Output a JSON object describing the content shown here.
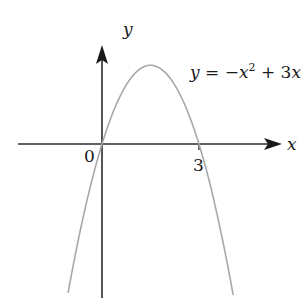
{
  "diagram": {
    "axes": {
      "x_label": "x",
      "y_label": "y",
      "origin_label": "0",
      "tick_labels": [
        "3"
      ]
    },
    "curve": {
      "equation_label": "y = −x² + 3x",
      "eq_y": "y",
      "eq_mid": " = −",
      "eq_x1": "x",
      "eq_exp": "2",
      "eq_plus": " + 3",
      "eq_x2": "x",
      "vertex": [
        1.5,
        2.25
      ],
      "roots": [
        0,
        3
      ],
      "color": "#a8a8a8"
    },
    "axis_color": "#2a2a2a"
  },
  "chart_data": {
    "type": "line",
    "xlabel": "x",
    "ylabel": "y",
    "x_ticks": [
      "0",
      "3"
    ],
    "series": [
      {
        "name": "y = -x^2 + 3x",
        "x": [
          -1.0,
          -0.5,
          0,
          0.5,
          1.0,
          1.5,
          2.0,
          2.5,
          3.0,
          3.5,
          4.0
        ],
        "values": [
          -4.0,
          -1.75,
          0,
          1.25,
          2.0,
          2.25,
          2.0,
          1.25,
          0,
          -1.75,
          -4.0
        ]
      }
    ],
    "grid": false
  }
}
